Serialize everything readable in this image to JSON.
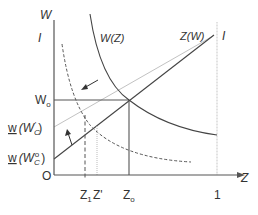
{
  "diagram": {
    "y_axis_label": "W",
    "x_axis_label": "Z",
    "origin_label": "O",
    "top_left_marker": "I",
    "top_right_marker": "I",
    "curves": {
      "w_of_z": "W(Z)",
      "z_of_w": "Z(W)"
    },
    "y_ticks": {
      "w0": "W",
      "w0_sub": "o",
      "w_wc1_main": "w",
      "w_wc1_paren": "(W",
      "w_wc1_sub": "C",
      "w_wc1_sup": "'",
      "w_wc1_close": ")",
      "w_wc0_main": "w",
      "w_wc0_paren": "(W",
      "w_wc0_sub": "C",
      "w_wc0_sup": "o",
      "w_wc0_close": ")"
    },
    "x_ticks": {
      "z1": "Z",
      "z1_sub": "1",
      "zprime": "Z'",
      "z0": "Z",
      "z0_sub": "o",
      "one": "1"
    },
    "colors": {
      "axis": "#555555",
      "curve": "#444444",
      "light_line": "#bbbbbb",
      "dotted_guide": "#c8c8c8"
    }
  }
}
